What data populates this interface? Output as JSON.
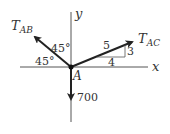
{
  "diagram": {
    "type": "free-body diagram",
    "origin_label": "A",
    "axes": {
      "x_label": "x",
      "y_label": "y"
    },
    "forces": [
      {
        "name": "T",
        "subscript": "AB",
        "direction": "up-left",
        "angle_label": "45°",
        "angle_from_x_label": "45°"
      },
      {
        "name": "T",
        "subscript": "AC",
        "direction": "up-right",
        "slope": {
          "hyp": "5",
          "rise": "3",
          "run": "4"
        }
      },
      {
        "name": "weight",
        "value": "700",
        "direction": "down"
      }
    ],
    "colors": {
      "line": "#333333",
      "background": "#ffffff"
    }
  },
  "labels": {
    "t_ab_main": "T",
    "t_ab_sub": "AB",
    "t_ac_main": "T",
    "t_ac_sub": "AC",
    "angle_upper": "45°",
    "angle_lower": "45°",
    "slope_hyp": "5",
    "slope_rise": "3",
    "slope_run": "4",
    "weight": "700",
    "point": "A",
    "x_axis": "x",
    "y_axis": "y"
  }
}
